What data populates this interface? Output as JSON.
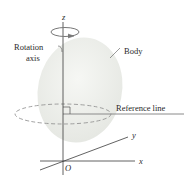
{
  "diagram": {
    "labels": {
      "z_axis": "z",
      "x_axis": "x",
      "y_axis": "y",
      "origin": "O",
      "rotation_axis_line1": "Rotation",
      "rotation_axis_line2": "axis",
      "body": "Body",
      "reference_line": "Reference line"
    },
    "colors": {
      "body_fill": "#eef0ec",
      "line": "#3a3a3a",
      "dashed_circle": "#8a8a8a",
      "reference_line": "#8a8a8a"
    }
  }
}
